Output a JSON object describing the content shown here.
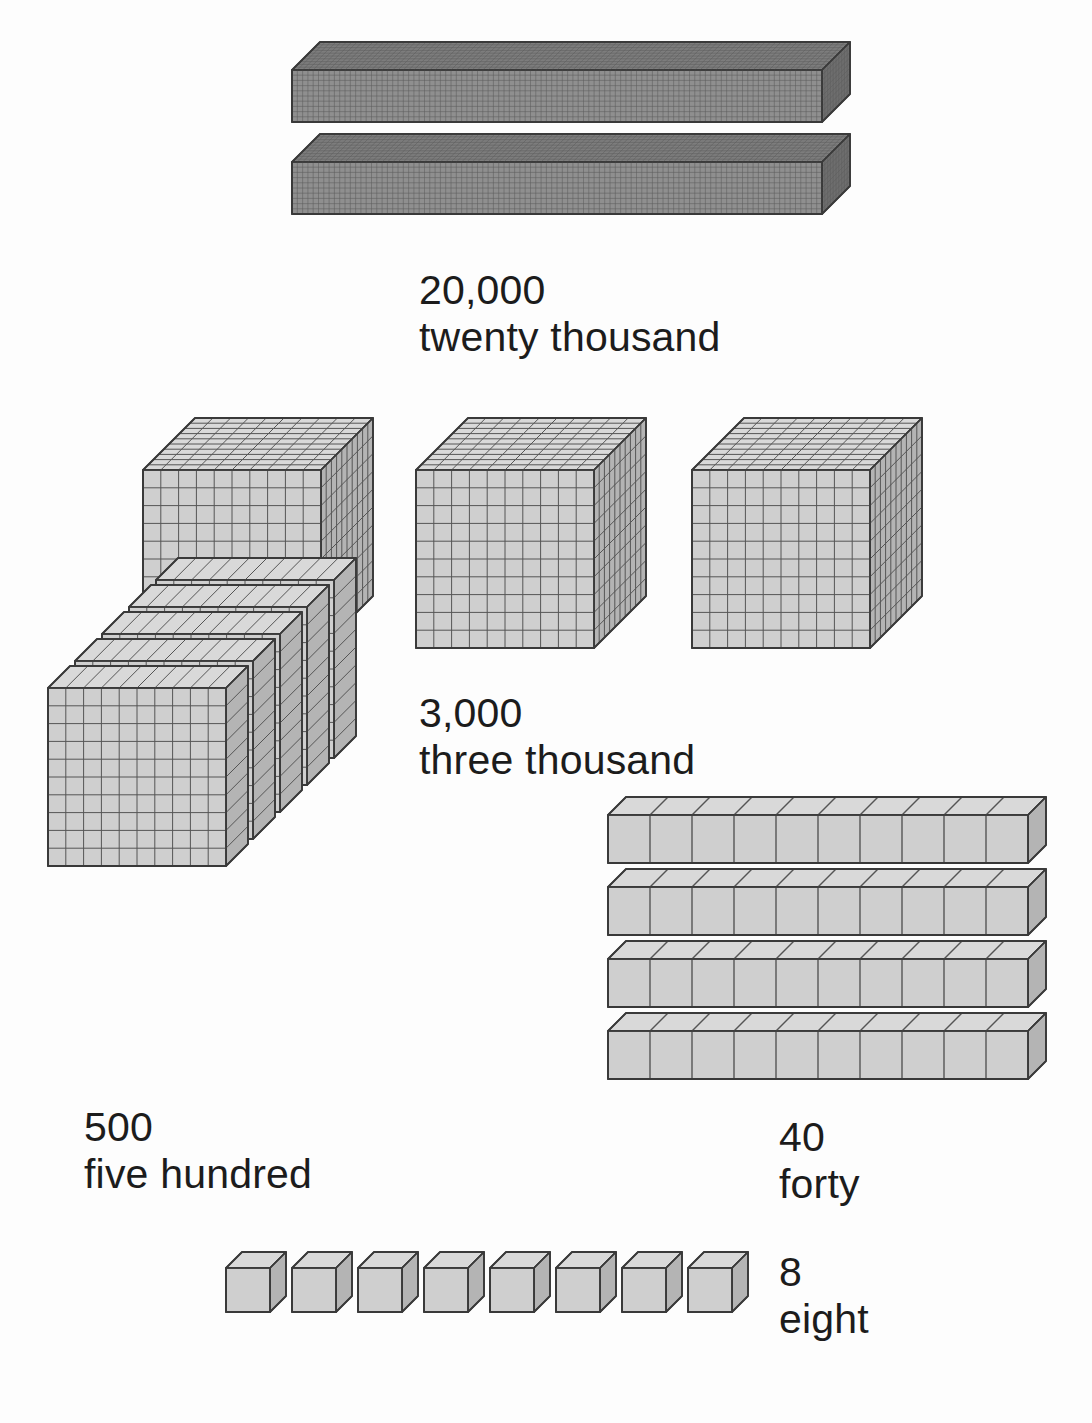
{
  "page": {
    "background_color": "#fdfdfd",
    "width": 1092,
    "height": 1423,
    "text_color": "#1c1c1c"
  },
  "colors": {
    "front_face": "#cfcfcf",
    "top_face": "#d9d9d9",
    "side_face": "#b4b4b4",
    "front_face_dark": "#8f8f8f",
    "top_face_dark": "#7d7d7d",
    "side_face_dark": "#6e6e6e",
    "outline": "#3a3a3a",
    "gridline": "#555555",
    "gridline_fine": "#6b6b6b"
  },
  "groups": [
    {
      "id": "ten-thousands",
      "place": "ten thousands",
      "digit": 2,
      "value": 20000,
      "number_label": "20,000",
      "word_label": "twenty thousand",
      "block_shape": "long-bar",
      "block_unit_value": 10000,
      "block_count": 2,
      "units_per_block": "10 x 10 x 100",
      "label_x": 419,
      "label_y": 267
    },
    {
      "id": "thousands",
      "place": "thousands",
      "digit": 3,
      "value": 3000,
      "number_label": "3,000",
      "word_label": "three thousand",
      "block_shape": "cube",
      "block_unit_value": 1000,
      "block_count": 3,
      "units_per_block": "10 x 10 x 10",
      "label_x": 419,
      "label_y": 690
    },
    {
      "id": "hundreds",
      "place": "hundreds",
      "digit": 5,
      "value": 500,
      "number_label": "500",
      "word_label": "five hundred",
      "block_shape": "flat",
      "block_unit_value": 100,
      "block_count": 5,
      "units_per_block": "10 x 10 x 1",
      "label_x": 84,
      "label_y": 1104
    },
    {
      "id": "tens",
      "place": "tens",
      "digit": 4,
      "value": 40,
      "number_label": "40",
      "word_label": "forty",
      "block_shape": "rod",
      "block_unit_value": 10,
      "block_count": 4,
      "units_per_block": "10 x 1 x 1",
      "label_x": 779,
      "label_y": 1114
    },
    {
      "id": "ones",
      "place": "ones",
      "digit": 8,
      "value": 8,
      "number_label": "8",
      "word_label": "eight",
      "block_shape": "unit-cube",
      "block_unit_value": 1,
      "block_count": 8,
      "units_per_block": "1 x 1 x 1",
      "label_x": 779,
      "label_y": 1249
    }
  ],
  "chart_data": {
    "type": "bar",
    "categories": [
      "20,000",
      "3,000",
      "500",
      "40",
      "8"
    ],
    "values": [
      20000,
      3000,
      500,
      40,
      8
    ],
    "xlabel": "",
    "ylabel": "",
    "annotations": [
      "twenty thousand",
      "three thousand",
      "five hundred",
      "forty",
      "eight"
    ]
  },
  "ten_thousand_bars": [
    {
      "x": 292,
      "y": 70,
      "length": 530,
      "height": 52,
      "depth": 28
    },
    {
      "x": 292,
      "y": 162,
      "length": 530,
      "height": 52,
      "depth": 28
    }
  ],
  "thousand_cubes": [
    {
      "x": 143,
      "y": 470,
      "size": 178,
      "depth": 52
    },
    {
      "x": 416,
      "y": 470,
      "size": 178,
      "depth": 52
    },
    {
      "x": 692,
      "y": 470,
      "size": 178,
      "depth": 52
    }
  ],
  "hundred_flats": {
    "start_x": 48,
    "start_y": 866,
    "size": 178,
    "count": 5,
    "offset_x": 27,
    "offset_y": -27
  },
  "ten_rods": [
    {
      "x": 608,
      "y": 815,
      "length": 420,
      "height": 48,
      "depth": 18
    },
    {
      "x": 608,
      "y": 887,
      "length": 420,
      "height": 48,
      "depth": 18
    },
    {
      "x": 608,
      "y": 959,
      "length": 420,
      "height": 48,
      "depth": 18
    },
    {
      "x": 608,
      "y": 1031,
      "length": 420,
      "height": 48,
      "depth": 18
    }
  ],
  "unit_cubes": {
    "start_x": 226,
    "y": 1268,
    "size": 44,
    "depth": 16,
    "count": 8,
    "spacing": 66
  }
}
